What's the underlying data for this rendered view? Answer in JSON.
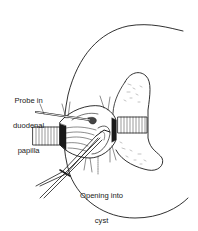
{
  "figure": {
    "colors": {
      "background": "#ffffff",
      "ink": "#1a1a1a"
    }
  },
  "labels": {
    "probe": {
      "line1": "Probe in",
      "line2": "duodenal",
      "line3": "papilla"
    },
    "opening": {
      "line1": "Opening into",
      "line2": "cyst"
    }
  }
}
